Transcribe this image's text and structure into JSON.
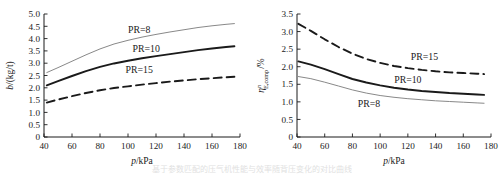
{
  "figure": {
    "background_color": "#ffffff",
    "ink_color": "#1a1a1a",
    "thin_line_color": "#7a7a7a",
    "caption_partial": "基于参数匹配的压气机性能与效率随背压变化的对比曲线"
  },
  "chart_data": [
    {
      "id": "left-panel",
      "type": "line",
      "title": "",
      "xlabel": "p/kPa",
      "ylabel": "b/(kg/t)",
      "xlim": [
        40,
        180
      ],
      "ylim": [
        0,
        5.0
      ],
      "xticks": [
        40,
        60,
        80,
        100,
        120,
        140,
        160,
        180
      ],
      "yticks": [
        "0",
        "0.5",
        "1.0",
        "1.5",
        "2.0",
        "2.5",
        "3.0",
        "3.5",
        "4.0",
        "4.5",
        "5.0"
      ],
      "grid": false,
      "legend_position": "inline-annotations",
      "series": [
        {
          "name": "PR=8",
          "style": "thin-solid",
          "label_x": 108,
          "label_y": 4.22,
          "x": [
            42,
            50,
            60,
            70,
            80,
            90,
            100,
            110,
            120,
            130,
            140,
            150,
            160,
            170,
            176
          ],
          "y": [
            2.62,
            2.82,
            3.08,
            3.34,
            3.58,
            3.78,
            3.93,
            4.06,
            4.17,
            4.27,
            4.36,
            4.45,
            4.52,
            4.58,
            4.61
          ]
        },
        {
          "name": "PR=10",
          "style": "thick-solid",
          "label_x": 113,
          "label_y": 3.46,
          "x": [
            42,
            50,
            60,
            70,
            80,
            90,
            100,
            110,
            120,
            130,
            140,
            150,
            160,
            170,
            176
          ],
          "y": [
            2.1,
            2.27,
            2.48,
            2.68,
            2.85,
            2.99,
            3.1,
            3.2,
            3.29,
            3.37,
            3.45,
            3.53,
            3.6,
            3.66,
            3.69
          ]
        },
        {
          "name": "PR=15",
          "style": "dashed",
          "label_x": 108,
          "label_y": 2.62,
          "x": [
            42,
            50,
            60,
            70,
            80,
            90,
            100,
            110,
            120,
            130,
            140,
            150,
            160,
            170,
            176
          ],
          "y": [
            1.4,
            1.52,
            1.66,
            1.79,
            1.9,
            1.99,
            2.06,
            2.13,
            2.19,
            2.25,
            2.3,
            2.35,
            2.39,
            2.43,
            2.45
          ]
        }
      ]
    },
    {
      "id": "right-panel",
      "type": "line",
      "title": "",
      "xlabel": "p/kPa",
      "ylabel": "η_E,comp^n/%",
      "ylabel_parts": {
        "base": "η",
        "sup": "n",
        "sub": "E,comp",
        "suffix": "/%"
      },
      "xlim": [
        40,
        180
      ],
      "ylim": [
        0,
        3.5
      ],
      "xticks": [
        40,
        60,
        80,
        100,
        120,
        140,
        160,
        180
      ],
      "yticks": [
        "0",
        "0.5",
        "1.0",
        "1.5",
        "2.0",
        "2.5",
        "3.0",
        "3.5"
      ],
      "grid": false,
      "legend_position": "inline-annotations",
      "series": [
        {
          "name": "PR=15",
          "style": "dashed",
          "label_x": 132,
          "label_y": 2.18,
          "x": [
            41,
            50,
            60,
            70,
            80,
            90,
            100,
            110,
            120,
            130,
            140,
            150,
            160,
            170,
            175
          ],
          "y": [
            3.22,
            3.02,
            2.78,
            2.56,
            2.37,
            2.22,
            2.11,
            2.02,
            1.96,
            1.91,
            1.87,
            1.84,
            1.82,
            1.8,
            1.79
          ]
        },
        {
          "name": "PR=10",
          "style": "thick-solid",
          "label_x": 120,
          "label_y": 1.55,
          "x": [
            41,
            50,
            60,
            70,
            80,
            90,
            100,
            110,
            120,
            130,
            140,
            150,
            160,
            170,
            175
          ],
          "y": [
            2.15,
            2.06,
            1.93,
            1.79,
            1.65,
            1.55,
            1.47,
            1.4,
            1.35,
            1.31,
            1.28,
            1.25,
            1.23,
            1.21,
            1.2
          ]
        },
        {
          "name": "PR=8",
          "style": "thin-solid",
          "label_x": 92,
          "label_y": 0.86,
          "x": [
            41,
            50,
            60,
            70,
            80,
            90,
            100,
            110,
            120,
            130,
            140,
            150,
            160,
            170,
            175
          ],
          "y": [
            1.72,
            1.66,
            1.56,
            1.45,
            1.34,
            1.25,
            1.18,
            1.13,
            1.09,
            1.06,
            1.03,
            1.01,
            0.99,
            0.97,
            0.96
          ]
        }
      ]
    }
  ]
}
